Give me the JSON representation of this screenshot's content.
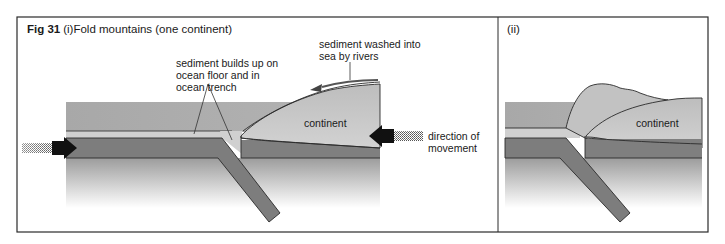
{
  "figure": {
    "number": "Fig 31",
    "panel_i_tag": "(i)",
    "title": "Fold mountains (one continent)",
    "panel_ii_tag": "(ii)"
  },
  "panel_i": {
    "labels": {
      "sediment_builds_line1": "sediment builds up on",
      "sediment_builds_line2": "ocean floor and in",
      "sediment_builds_line3": "ocean trench",
      "sediment_washed_line1": "sediment washed into",
      "sediment_washed_line2": "sea by rivers",
      "continent": "continent",
      "direction_line1": "direction of",
      "direction_line2": "movement"
    }
  },
  "panel_ii": {
    "labels": {
      "continent": "continent"
    }
  },
  "colors": {
    "sea": "#a9a9a9",
    "sediment": "#cfcfcf",
    "oceanic_plate": "#7d7d7d",
    "continent": "#c4c4c4",
    "mantle_top": "#9a9a9a",
    "outline": "#2a2a2a",
    "arrow": "#111111"
  }
}
